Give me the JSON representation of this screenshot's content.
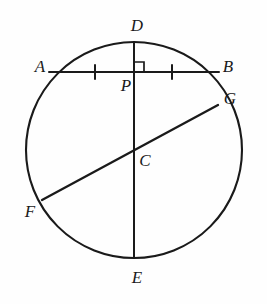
{
  "figure": {
    "type": "circle-geometry-diagram",
    "canvas": {
      "width": 267,
      "height": 304
    },
    "background_color": "#fefefe",
    "stroke_color": "#1a1a1a",
    "label_color": "#1a1a1a"
  },
  "circle": {
    "center_label": "C",
    "cx": 134,
    "cy": 150,
    "r": 108,
    "stroke_width": 2.1
  },
  "points": {
    "A": {
      "x": 49,
      "y": 72
    },
    "B": {
      "x": 219,
      "y": 72
    },
    "C": {
      "x": 134,
      "y": 150
    },
    "D": {
      "x": 134,
      "y": 42
    },
    "E": {
      "x": 134,
      "y": 258
    },
    "F": {
      "x": 42,
      "y": 200
    },
    "G": {
      "x": 218,
      "y": 105
    },
    "P": {
      "x": 134,
      "y": 72
    }
  },
  "segments": [
    {
      "name": "chord-ab",
      "from": "A",
      "to": "B",
      "x1": 49,
      "y1": 72,
      "x2": 219,
      "y2": 72,
      "stroke_width": 2.0
    },
    {
      "name": "diameter-de",
      "from": "D",
      "to": "E",
      "x1": 134,
      "y1": 42,
      "x2": 134,
      "y2": 258,
      "stroke_width": 2.0
    },
    {
      "name": "diameter-fg",
      "from": "F",
      "to": "G",
      "x1": 42,
      "y1": 200,
      "x2": 218,
      "y2": 105,
      "stroke_width": 2.3
    }
  ],
  "tick_marks": [
    {
      "name": "tick-ap",
      "x": 95,
      "y": 72,
      "half_height": 7
    },
    {
      "name": "tick-pb",
      "x": 172,
      "y": 72,
      "half_height": 7
    }
  ],
  "right_angle": {
    "name": "right-angle-at-p",
    "vertex_x": 134,
    "vertex_y": 72,
    "size": 10,
    "direction": "up-right"
  },
  "labels": [
    {
      "id": "A",
      "text": "A",
      "x": 40,
      "y": 66
    },
    {
      "id": "B",
      "text": "B",
      "x": 228,
      "y": 66
    },
    {
      "id": "C",
      "text": "C",
      "x": 145,
      "y": 160
    },
    {
      "id": "D",
      "text": "D",
      "x": 137,
      "y": 25
    },
    {
      "id": "E",
      "text": "E",
      "x": 137,
      "y": 277
    },
    {
      "id": "F",
      "text": "F",
      "x": 30,
      "y": 211
    },
    {
      "id": "G",
      "text": "G",
      "x": 230,
      "y": 98
    },
    {
      "id": "P",
      "text": "P",
      "x": 126,
      "y": 85
    }
  ],
  "chart_data": {
    "type": "diagram",
    "elements": {
      "circle_center": "C",
      "diameters": [
        "DE",
        "FG"
      ],
      "chords": [
        "AB"
      ],
      "perpendicular_foot": "P",
      "congruent_segments": [
        "AP",
        "PB"
      ],
      "right_angle_vertex": "P"
    },
    "vertex_labels": [
      "A",
      "B",
      "C",
      "D",
      "E",
      "F",
      "G",
      "P"
    ]
  }
}
